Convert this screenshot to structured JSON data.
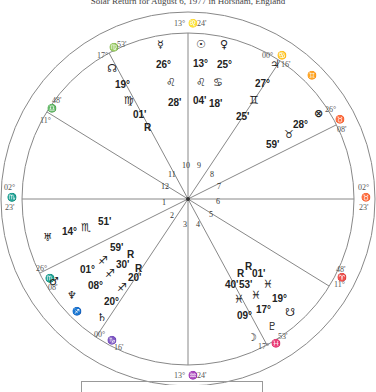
{
  "title": "Solar Return for August 6, 1977 in Horsham, England",
  "cusps": [
    {
      "house": 1,
      "label_deg": "02°",
      "sign": "♏",
      "label_min": "23'",
      "side": "left"
    },
    {
      "house": 2,
      "label_deg": "26°",
      "sign": "♏",
      "label_min": "08'"
    },
    {
      "house": 3,
      "label_deg": "00°",
      "sign": "♑",
      "label_min": "16'"
    },
    {
      "house": 4,
      "label_deg": "13°",
      "sign": "♒",
      "label_min": "24'"
    },
    {
      "house": 5,
      "label_deg": "17°",
      "sign": "♓",
      "label_min": "53'"
    },
    {
      "house": 6,
      "label_deg": "11°",
      "sign": "♈",
      "label_min": "48'"
    },
    {
      "house": 7,
      "label_deg": "02°",
      "sign": "♉",
      "label_min": "23'"
    },
    {
      "house": 8,
      "label_deg": "26°",
      "sign": "♉",
      "label_min": "08'"
    },
    {
      "house": 9,
      "label_deg": "00°",
      "sign": "♋",
      "label_min": "16'"
    },
    {
      "house": 10,
      "label_deg": "13°",
      "sign": "♌",
      "label_min": "24'"
    },
    {
      "house": 11,
      "label_deg": "17°",
      "sign": "♍",
      "label_min": "53'"
    },
    {
      "house": 12,
      "label_deg": "11°",
      "sign": "♎",
      "label_min": "48'"
    }
  ],
  "intercepted_signs": {
    "gemini": "♊",
    "sagittarius": "♐"
  },
  "planets": [
    {
      "name": "Mercury",
      "glyph": "☿",
      "deg": "26°",
      "sign": "♌",
      "min": "28'"
    },
    {
      "name": "Sun",
      "glyph": "☉",
      "deg": "13°",
      "sign": "♌",
      "min": "04'"
    },
    {
      "name": "Venus",
      "glyph": "♀",
      "deg": "25°",
      "sign": "♋",
      "min": "18'"
    },
    {
      "name": "Jupiter",
      "glyph": "♃",
      "deg": "27°",
      "sign": "♊",
      "min": "25'"
    },
    {
      "name": "Part of Fortune",
      "glyph": "⊗",
      "deg": "28°",
      "sign": "♉",
      "min": "59'"
    },
    {
      "name": "North Node",
      "glyph": "☊",
      "deg": "19°",
      "sign": "♍",
      "min": "01'",
      "retro": "R"
    },
    {
      "name": "Uranus",
      "glyph": "♅",
      "deg": "14°",
      "sign": "♏",
      "min": "51'"
    },
    {
      "name": "Mars",
      "glyph": "♂",
      "deg": "01°",
      "sign": "♐",
      "min": "59'",
      "retro": "R"
    },
    {
      "name": "Neptune",
      "glyph": "♆",
      "deg": "08°",
      "sign": "♐",
      "min": "30'",
      "retro": "R"
    },
    {
      "name": "Saturn",
      "glyph": "♄",
      "deg": "20°",
      "sign": "♐",
      "min": "20'"
    },
    {
      "name": "Moon",
      "glyph": "☽",
      "deg": "09°",
      "sign": "♓",
      "min": "40'",
      "retro": "R"
    },
    {
      "name": "Pluto",
      "glyph": "♇",
      "deg": "17°",
      "sign": "♓",
      "min": "53'",
      "retro": "R"
    },
    {
      "name": "South Node",
      "glyph": "☋",
      "deg": "19°",
      "sign": "♓",
      "min": "01'"
    }
  ],
  "house_numbers": [
    "1",
    "2",
    "3",
    "4",
    "5",
    "6",
    "7",
    "8",
    "9",
    "10",
    "11",
    "12"
  ]
}
